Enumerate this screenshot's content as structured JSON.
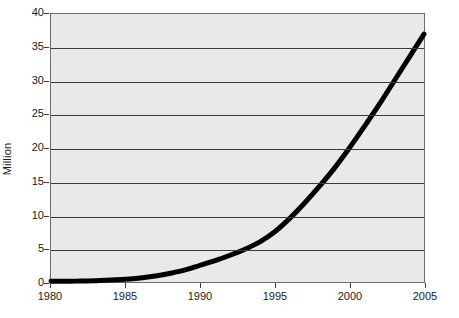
{
  "chart_data": {
    "type": "line",
    "title": "",
    "subtitle": "",
    "xlabel": "",
    "ylabel": "Million",
    "xlim": [
      1980,
      2005
    ],
    "ylim": [
      0,
      40
    ],
    "grid": true,
    "legend": null,
    "legend_position": "none",
    "xticks": [
      1980,
      1985,
      1990,
      1995,
      2000,
      2005
    ],
    "yticks": [
      0,
      5,
      10,
      15,
      20,
      25,
      30,
      35,
      40
    ],
    "series": [
      {
        "name": "Million",
        "color": "#000000",
        "line_width": 5,
        "x": [
          1980,
          1981,
          1982,
          1983,
          1984,
          1985,
          1986,
          1987,
          1988,
          1989,
          1990,
          1991,
          1992,
          1993,
          1994,
          1995,
          1996,
          1997,
          1998,
          1999,
          2000,
          2001,
          2002,
          2003,
          2004,
          2005
        ],
        "values": [
          0.1,
          0.1,
          0.15,
          0.2,
          0.3,
          0.4,
          0.6,
          0.9,
          1.3,
          1.8,
          2.5,
          3.2,
          4.0,
          4.9,
          6.0,
          7.5,
          9.5,
          11.8,
          14.3,
          17.0,
          20.0,
          23.2,
          26.5,
          30.0,
          33.5,
          37.0
        ]
      }
    ]
  },
  "axis": {
    "ylabel": "Million",
    "ytick_labels": [
      "0",
      "5",
      "10",
      "15",
      "20",
      "25",
      "30",
      "35",
      "40"
    ],
    "xtick_labels": [
      "1980",
      "1985",
      "1990",
      "1995",
      "2000",
      "2005"
    ]
  },
  "colors": {
    "plot_background": "#e9e9e9",
    "page_background": "#ffffff",
    "gridline": "#3b3b3b",
    "frame": "#6b6b6b",
    "series": "#000000",
    "text": "#1a1a1a"
  }
}
